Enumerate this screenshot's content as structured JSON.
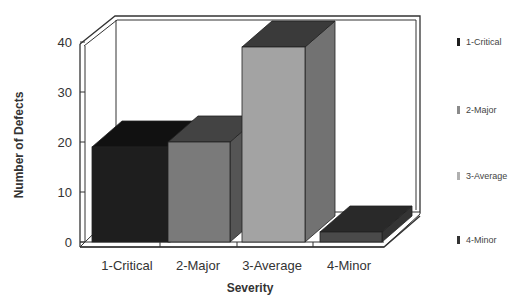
{
  "chart_data": {
    "type": "bar",
    "style": "3d",
    "title": "",
    "xlabel": "Severity",
    "ylabel": "Number of Defects",
    "categories": [
      "1-Critical",
      "2-Major",
      "3-Average",
      "4-Minor"
    ],
    "values": [
      19,
      20,
      39,
      2
    ],
    "ylim": [
      0,
      40
    ],
    "yticks": [
      "0",
      "10",
      "20",
      "30",
      "40"
    ],
    "grid": false,
    "legend": {
      "position": "right",
      "entries": [
        "1-Critical",
        "2-Major",
        "3-Average",
        "4-Minor"
      ]
    },
    "colors": {
      "1-Critical": "#1e1e1e",
      "2-Major": "#7a7a7a",
      "3-Average": "#a3a3a3",
      "4-Minor": "#4a4a4a"
    }
  }
}
